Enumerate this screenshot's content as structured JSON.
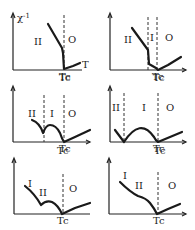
{
  "figure": {
    "y_axis_label": "χ⁻¹",
    "x_axis_label": "T",
    "tc_label": "Tc",
    "panels": [
      {
        "id": 1,
        "regions": [
          "II",
          "O"
        ],
        "dashed_lines": 1
      },
      {
        "id": 2,
        "regions": [
          "II",
          "I",
          "O"
        ],
        "dashed_lines": 2
      },
      {
        "id": 3,
        "regions": [
          "II",
          "I",
          "O"
        ],
        "dashed_lines": 2
      },
      {
        "id": 4,
        "regions": [
          "II",
          "I",
          "O"
        ],
        "dashed_lines": 2
      },
      {
        "id": 5,
        "regions": [
          "I",
          "II",
          "O"
        ],
        "dashed_lines": 1
      },
      {
        "id": 6,
        "regions": [
          "I",
          "II",
          "O"
        ],
        "dashed_lines": 1
      }
    ]
  },
  "p1": {
    "r1": "II",
    "r2": "O",
    "tc": "Tc",
    "ylabel": "χ",
    "ysup": "-1",
    "xlabel": "T"
  },
  "p2": {
    "r1": "II",
    "r2": "I",
    "r3": "O",
    "tc": "Tc"
  },
  "p3": {
    "r1": "II",
    "r2": "I",
    "r3": "O",
    "tc": "Tc"
  },
  "p4": {
    "r1": "II",
    "r2": "I",
    "r3": "O",
    "tc": "Tc"
  },
  "p5": {
    "r1": "I",
    "r2": "II",
    "r3": "O",
    "tc": "Tc"
  },
  "p6": {
    "r1": "I",
    "r2": "II",
    "r3": "O",
    "tc": "Tc"
  }
}
